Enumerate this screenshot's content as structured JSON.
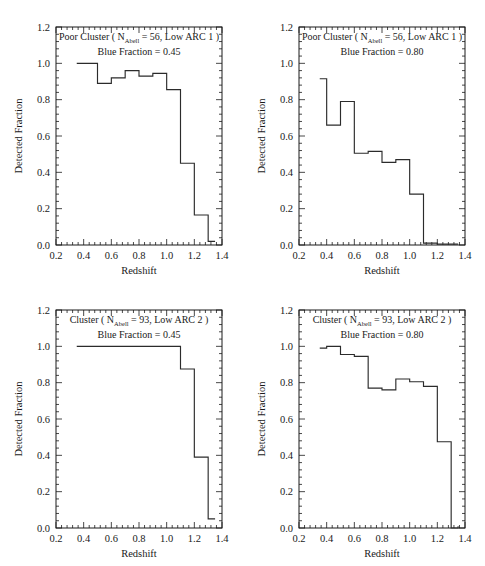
{
  "figure": {
    "background_color": "#ffffff",
    "line_color": "#2b2b2b",
    "panel_count": 4
  },
  "axes": {
    "xlabel": "Redshift",
    "ylabel": "Detected Fraction",
    "xlim": [
      0.2,
      1.4
    ],
    "ylim": [
      0.0,
      1.2
    ],
    "xticks": [
      "0.2",
      "0.4",
      "0.6",
      "0.8",
      "1.0",
      "1.2",
      "1.4"
    ],
    "yticks": [
      "0.0",
      "0.2",
      "0.4",
      "0.6",
      "0.8",
      "1.0",
      "1.2"
    ],
    "xtick_values": [
      0.2,
      0.4,
      0.6,
      0.8,
      1.0,
      1.2,
      1.4
    ],
    "ytick_values": [
      0.0,
      0.2,
      0.4,
      0.6,
      0.8,
      1.0,
      1.2
    ],
    "minor_ticks_per_interval": 5,
    "grid": false
  },
  "chart_data": [
    {
      "id": "panel-top-left",
      "type": "line",
      "title_prefix": "Poor Cluster ( N",
      "title_subscript": "Abell",
      "title_suffix": " = 56, Low ARC 1 )",
      "subtitle": "Blue Fraction = 0.45",
      "blue_fraction": 0.45,
      "n_abell": 56,
      "cluster_type": "Poor Cluster",
      "arc_label": "Low ARC 1",
      "title": "Poor Cluster ( N_Abell = 56, Low ARC 1 )",
      "xlabel": "Redshift",
      "ylabel": "Detected Fraction",
      "xlim": [
        0.2,
        1.4
      ],
      "ylim": [
        0.0,
        1.2
      ],
      "bin_edges": [
        0.35,
        0.5,
        0.6,
        0.7,
        0.8,
        0.9,
        1.0,
        1.1,
        1.2,
        1.3,
        1.35
      ],
      "values": [
        1.0,
        0.89,
        0.92,
        0.96,
        0.93,
        0.945,
        0.855,
        0.45,
        0.165,
        0.02
      ]
    },
    {
      "id": "panel-top-right",
      "type": "line",
      "title_prefix": "Poor Cluster ( N",
      "title_subscript": "Abell",
      "title_suffix": " = 56, Low ARC 1 )",
      "subtitle": "Blue Fraction = 0.80",
      "blue_fraction": 0.8,
      "n_abell": 56,
      "cluster_type": "Poor Cluster",
      "arc_label": "Low ARC 1",
      "title": "Poor Cluster ( N_Abell = 56, Low ARC 1 )",
      "xlabel": "Redshift",
      "ylabel": "Detected Fraction",
      "xlim": [
        0.2,
        1.4
      ],
      "ylim": [
        0.0,
        1.2
      ],
      "bin_edges": [
        0.35,
        0.4,
        0.5,
        0.6,
        0.7,
        0.8,
        0.9,
        1.0,
        1.1,
        1.2,
        1.35
      ],
      "values": [
        0.915,
        0.66,
        0.79,
        0.505,
        0.515,
        0.455,
        0.47,
        0.28,
        0.01,
        0.005
      ]
    },
    {
      "id": "panel-bottom-left",
      "type": "line",
      "title_prefix": "Cluster ( N",
      "title_subscript": "Abell",
      "title_suffix": " = 93, Low ARC 2 )",
      "subtitle": "Blue Fraction = 0.45",
      "blue_fraction": 0.45,
      "n_abell": 93,
      "cluster_type": "Cluster",
      "arc_label": "Low ARC 2",
      "title": "Cluster ( N_Abell = 93, Low ARC 2 )",
      "xlabel": "Redshift",
      "ylabel": "Detected Fraction",
      "xlim": [
        0.2,
        1.4
      ],
      "ylim": [
        0.0,
        1.2
      ],
      "bin_edges": [
        0.35,
        1.1,
        1.2,
        1.3,
        1.35
      ],
      "values": [
        1.0,
        0.875,
        0.39,
        0.05
      ]
    },
    {
      "id": "panel-bottom-right",
      "type": "line",
      "title_prefix": "Cluster ( N",
      "title_subscript": "Abell",
      "title_suffix": " = 93, Low ARC 2 )",
      "subtitle": "Blue Fraction = 0.80",
      "blue_fraction": 0.8,
      "n_abell": 93,
      "cluster_type": "Cluster",
      "arc_label": "Low ARC 2",
      "title": "Cluster ( N_Abell = 93, Low ARC 2 )",
      "xlabel": "Redshift",
      "ylabel": "Detected Fraction",
      "xlim": [
        0.2,
        1.4
      ],
      "ylim": [
        0.0,
        1.2
      ],
      "bin_edges": [
        0.35,
        0.4,
        0.5,
        0.6,
        0.7,
        0.8,
        0.9,
        1.0,
        1.1,
        1.2,
        1.3,
        1.35
      ],
      "values": [
        0.99,
        1.0,
        0.955,
        0.945,
        0.77,
        0.76,
        0.82,
        0.805,
        0.78,
        0.475,
        0.0,
        0.01
      ]
    }
  ]
}
